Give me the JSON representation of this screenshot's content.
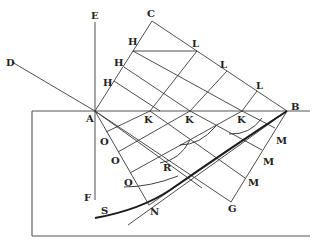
{
  "diagram": {
    "type": "geometric construction (wavefront refraction)",
    "labels": {
      "E": "E",
      "D": "D",
      "C": "C",
      "A": "A",
      "B": "B",
      "F": "F",
      "G": "G",
      "N": "N",
      "S": "S",
      "R": "R",
      "H1": "H",
      "H2": "H",
      "H3": "H",
      "L1": "L",
      "L2": "L",
      "L3": "L",
      "K1": "K",
      "K2": "K",
      "K3": "K",
      "O1": "O",
      "O2": "O",
      "O3": "O",
      "M1": "M",
      "M2": "M",
      "M3": "M"
    },
    "points": {
      "A": [
        95,
        111
      ],
      "B": [
        287,
        111
      ],
      "C": [
        152,
        21
      ],
      "G": [
        231,
        202
      ],
      "E": [
        95,
        22
      ],
      "F": [
        95,
        200
      ],
      "D": [
        12,
        62
      ],
      "N": [
        149,
        205
      ]
    }
  }
}
